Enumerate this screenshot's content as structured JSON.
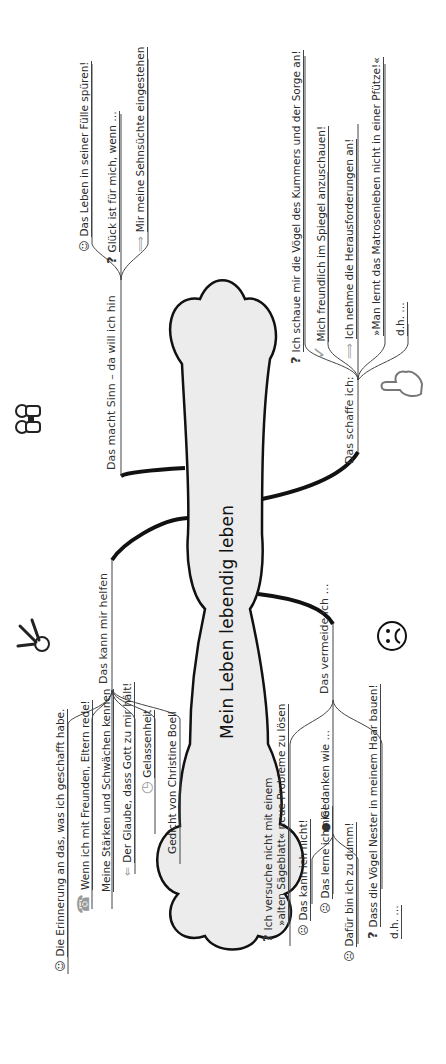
{
  "center": {
    "title": "Mein Leben lebendig leben"
  },
  "branches": {
    "sinn": {
      "label": "Das macht Sinn – da will ich hin",
      "items": [
        {
          "icon": "smile-icon",
          "glyph": "☺",
          "text": "Das Leben in seiner Fülle spüren!"
        },
        {
          "icon": "question-icon",
          "glyph": "?",
          "text": "Glück ist für mich, wenn …"
        },
        {
          "icon": "arrow-icon",
          "glyph": "⟹",
          "text": "Mir meine Sehnsüchte eingestehen"
        }
      ],
      "illustration": "binoculars-icon"
    },
    "schaffe": {
      "label": "Das schaffe ich:",
      "items": [
        {
          "icon": "question-icon",
          "glyph": "?",
          "text": "Ich schaue mir die Vögel des Kummers und der Sorge an!"
        },
        {
          "icon": "check-icon",
          "glyph": "✓",
          "text": "Mich freundlich im Spiegel anzuschauen!"
        },
        {
          "icon": "arrow-icon",
          "glyph": "⟹",
          "text": "Ich nehme die Herausforderungen an!"
        },
        {
          "icon": "",
          "glyph": "",
          "text": "»Man lernt das Matrosenleben nicht in einer Pfütze!«"
        },
        {
          "icon": "",
          "glyph": "",
          "text": "d.h. …"
        }
      ],
      "illustration": "thumbs-down-hand-icon"
    },
    "helfen": {
      "label": "Das kann mir helfen",
      "items": [
        {
          "icon": "smile-icon",
          "glyph": "☺",
          "text": "Die Erinnerung an das, was ich geschafft habe."
        },
        {
          "icon": "telephone-icon",
          "glyph": "☎",
          "text": "Wenn ich mit Freunden, Eltern rede!"
        },
        {
          "icon": "",
          "glyph": "",
          "text": "Meine Stärken und Schwächen kennen"
        },
        {
          "icon": "arrow-icon",
          "glyph": "⇐",
          "text": "Der Glaube, dass Gott zu mir hält!"
        },
        {
          "icon": "clock-icon",
          "glyph": "◷",
          "text": "Gelassenheit"
        },
        {
          "icon": "",
          "glyph": "",
          "text": "Gedicht von Christine Boell"
        }
      ],
      "illustration": "keys-icon"
    },
    "vermeide": {
      "label": "Das vermeide ich …",
      "items": [
        {
          "icon": "question-icon",
          "glyph": "?",
          "text": "Ich versuche nicht mit einem"
        },
        {
          "icon": "",
          "glyph": "",
          "text": "»alten Sägeblatt« neue Probleme zu lösen"
        },
        {
          "icon": "bomb-icon",
          "glyph": "●",
          "text": "Gedanken wie …"
        },
        {
          "icon": "sad-icon",
          "glyph": "☹",
          "text": "Das kann ich nicht!"
        },
        {
          "icon": "sad-icon",
          "glyph": "☹",
          "text": "Das lerne ich nie!"
        },
        {
          "icon": "sad-icon",
          "glyph": "☹",
          "text": "Dafür bin ich zu dumm!"
        },
        {
          "icon": "question-icon",
          "glyph": "?",
          "text": "Dass die Vögel Nester in meinem Haar bauen!"
        },
        {
          "icon": "",
          "glyph": "",
          "text": "d.h. …"
        }
      ],
      "illustration": "sad-face-icon"
    }
  },
  "colors": {
    "cloud_fill": "#ececec",
    "cloud_stroke": "#111111",
    "line": "#444444",
    "text": "#2a2a2a"
  }
}
